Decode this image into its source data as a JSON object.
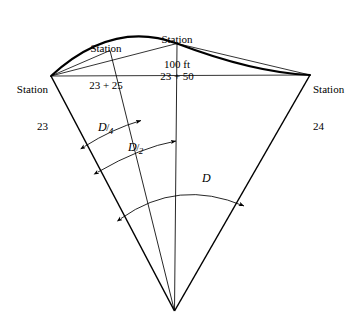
{
  "figure": {
    "type": "surveying-circular-curve-diagram",
    "background_color": "#ffffff",
    "line_color": "#000000"
  },
  "stations": {
    "left": {
      "name": "station-23",
      "line1": "Station",
      "line2": "23"
    },
    "quarter": {
      "name": "station-23-plus-25",
      "line1": "Station",
      "line2": "23 + 25"
    },
    "mid": {
      "name": "station-23-plus-50",
      "line1": "Station",
      "line2": "23 + 50"
    },
    "right": {
      "name": "station-24",
      "line1": "Station",
      "line2": "24"
    }
  },
  "chord": {
    "long_chord_label": "100 ft"
  },
  "angles": {
    "quarter": {
      "symbol": "D",
      "slash": "/",
      "denominator": "4"
    },
    "half": {
      "symbol": "D",
      "slash": "/",
      "denominator": "2"
    },
    "full": {
      "symbol": "D",
      "slash": "",
      "denominator": ""
    }
  }
}
